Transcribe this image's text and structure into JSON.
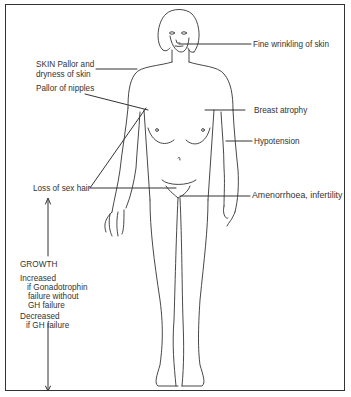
{
  "figure": {
    "type": "anatomical-diagram",
    "labels": {
      "fine_wrinkling": "Fine wrinkling of skin",
      "skin_line1": "SKIN Pallor and",
      "skin_line2": "dryness of skin",
      "pallor_nipples": "Pallor of nipples",
      "breast_atrophy": "Breast atrophy",
      "hypotension": "Hypotension",
      "loss_sex_hair": "Loss of sex hair",
      "amenorrhoea": "Amenorrhoea, infertility",
      "growth_heading": "GROWTH",
      "increased": "Increased",
      "increased_detail1": "if Gonadotrophin",
      "increased_detail2": "failure without",
      "increased_detail3": "GH failure",
      "decreased": "Decreased",
      "decreased_detail": "if GH failure"
    },
    "colors": {
      "line": "#333333",
      "background": "#ffffff"
    }
  }
}
